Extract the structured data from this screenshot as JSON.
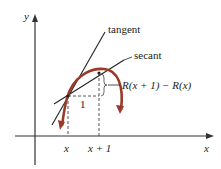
{
  "diagram": {
    "axes": {
      "x_label": "x",
      "y_label": "y"
    },
    "lines": {
      "tangent_label": "tangent",
      "secant_label": "secant"
    },
    "annotation": {
      "difference_label": "R(x + 1) − R(x)",
      "run_label": "1"
    },
    "ticks": {
      "x_label": "x",
      "x_plus_1_label": "x + 1"
    },
    "colors": {
      "curve": "#9c3a2a",
      "axes": "#333333",
      "lines": "#222222",
      "dashed": "#444444"
    }
  }
}
